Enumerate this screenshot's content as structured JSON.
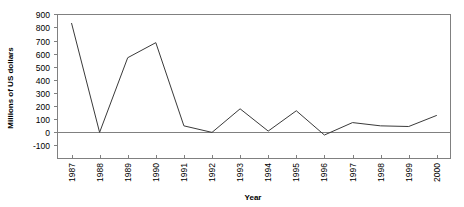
{
  "chart_data": {
    "type": "line",
    "title": "",
    "subtitle": "",
    "xlabel": "Year",
    "ylabel": "Millions of US dollars",
    "categories": [
      "1987",
      "1988",
      "1989",
      "1990",
      "1991",
      "1992",
      "1993",
      "1994",
      "1995",
      "1996",
      "1997",
      "1998",
      "1999",
      "2000"
    ],
    "values": [
      835,
      0,
      570,
      685,
      50,
      0,
      180,
      10,
      165,
      -20,
      75,
      50,
      45,
      130
    ],
    "series": [
      {
        "name": "",
        "values": [
          835,
          0,
          570,
          685,
          50,
          0,
          180,
          10,
          165,
          -20,
          75,
          50,
          45,
          130
        ]
      }
    ],
    "ylim": [
      -100,
      900
    ],
    "ytick_step": 100,
    "ytick_labels": [
      "900",
      "800",
      "700",
      "600",
      "500",
      "400",
      "300",
      "200",
      "100",
      "0",
      "-100"
    ],
    "ytick_values": [
      900,
      800,
      700,
      600,
      500,
      400,
      300,
      200,
      100,
      0,
      -100
    ],
    "xtick_labels": [
      "1987",
      "1988",
      "1989",
      "1990",
      "1991",
      "1992",
      "1993",
      "1994",
      "1995",
      "1996",
      "1997",
      "1998",
      "1999",
      "2000"
    ],
    "grid": false,
    "legend": false,
    "legend_position": "none",
    "xtick_rotation": -90,
    "annotations": [],
    "colors": {
      "line": "#3a3a3a",
      "axis": "#808080",
      "text": "#000000",
      "background": "#ffffff"
    }
  }
}
